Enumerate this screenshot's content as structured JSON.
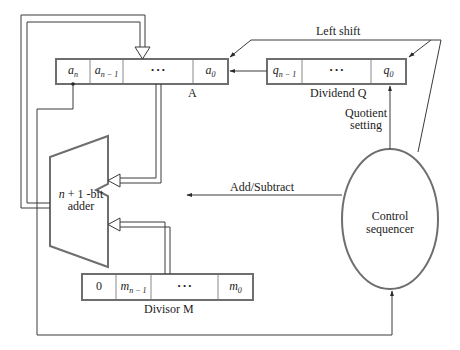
{
  "diagram": {
    "register_a": {
      "label": "A",
      "cells": [
        {
          "var": "a",
          "sub": "n"
        },
        {
          "var": "a",
          "sub": "n − 1"
        },
        {
          "var": "• • •",
          "sub": ""
        },
        {
          "var": "a",
          "sub": "0"
        }
      ]
    },
    "register_q": {
      "label": "Dividend Q",
      "cells": [
        {
          "var": "q",
          "sub": "n − 1"
        },
        {
          "var": "• • •",
          "sub": ""
        },
        {
          "var": "q",
          "sub": "0"
        }
      ]
    },
    "register_m": {
      "label": "Divisor M",
      "cells": [
        {
          "var": "0",
          "sub": ""
        },
        {
          "var": "m",
          "sub": "n − 1"
        },
        {
          "var": "• • •",
          "sub": ""
        },
        {
          "var": "m",
          "sub": "0"
        }
      ]
    },
    "adder": {
      "line1_pre": "n",
      "line1_post": " + 1 -bit",
      "line2": "adder"
    },
    "control": {
      "line1": "Control",
      "line2": "sequencer"
    },
    "signals": {
      "left_shift": "Left shift",
      "quotient_line1": "Quotient",
      "quotient_line2": "setting",
      "add_subtract": "Add/Subtract"
    },
    "colors": {
      "line": "#3a3a3a",
      "shape": "#6e6e6e",
      "background": "#ffffff"
    }
  }
}
